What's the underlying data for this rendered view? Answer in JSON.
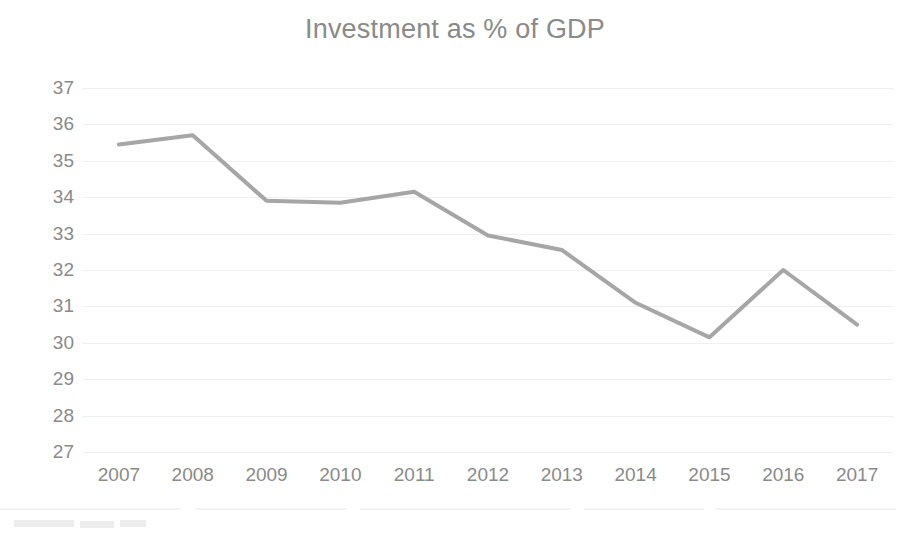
{
  "chart_data": {
    "type": "line",
    "title": "Investment as % of GDP",
    "xlabel": "",
    "ylabel": "",
    "categories": [
      "2007",
      "2008",
      "2009",
      "2010",
      "2011",
      "2012",
      "2013",
      "2014",
      "2015",
      "2016",
      "2017"
    ],
    "values": [
      35.45,
      35.7,
      33.9,
      33.85,
      34.15,
      32.95,
      32.55,
      31.1,
      30.15,
      32.0,
      30.5
    ],
    "ylim": [
      27,
      37
    ],
    "yticks": [
      37,
      36,
      35,
      34,
      33,
      32,
      31,
      30,
      29,
      28,
      27
    ],
    "ytick_labels": [
      "37",
      "36",
      "35",
      "34",
      "33",
      "32",
      "31",
      "30",
      "29",
      "28",
      "27"
    ],
    "grid": true,
    "grid_axis": "y",
    "legend": false,
    "legend_position": "none",
    "series_color": "#a6a6a6",
    "series_name": "Investment as % of GDP",
    "line_width": 4,
    "markers": false,
    "axis_label_color": "#8a8a8a",
    "title_color": "#8a8a8a",
    "background_color": "#ffffff"
  },
  "colors": {
    "accent": "#a6a6a6",
    "grid": "#f0f0f0",
    "text": "#8a8a8a",
    "background": "#ffffff"
  }
}
